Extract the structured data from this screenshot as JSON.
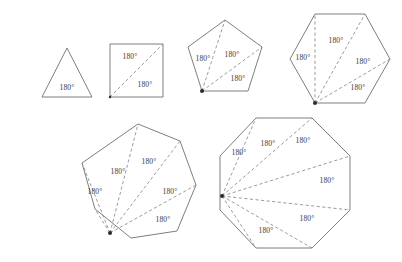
{
  "figure": {
    "background_color": "#ffffff",
    "outline_color": "#6f6f6f",
    "diagonal_color": "#8a8a8a",
    "label_color": "#3a3a3a",
    "apex_dot_color": "#2b2b2b",
    "angle_label": "180°",
    "degree_symbol": "°"
  },
  "chart_data": {
    "type": "diagram",
    "shapes": [
      {
        "name": "triangle",
        "sides": 3,
        "triangles": 1,
        "angle_sum_degrees": 180,
        "labels": [
          "180°"
        ]
      },
      {
        "name": "square",
        "sides": 4,
        "triangles": 2,
        "angle_sum_degrees": 360,
        "labels": [
          "180°",
          "180°"
        ]
      },
      {
        "name": "pentagon",
        "sides": 5,
        "triangles": 3,
        "angle_sum_degrees": 540,
        "labels": [
          "180°",
          "180°",
          "180°"
        ]
      },
      {
        "name": "hexagon",
        "sides": 6,
        "triangles": 4,
        "angle_sum_degrees": 720,
        "labels": [
          "180°",
          "180°",
          "180°",
          "180°"
        ]
      },
      {
        "name": "heptagon",
        "sides": 7,
        "triangles": 5,
        "angle_sum_degrees": 900,
        "labels": [
          "180°",
          "180°",
          "180°",
          "180°",
          "180°"
        ]
      },
      {
        "name": "octagon",
        "sides": 8,
        "triangles": 6,
        "angle_sum_degrees": 1080,
        "labels": [
          "180°",
          "180°",
          "180°",
          "180°",
          "180°",
          "180°"
        ]
      }
    ]
  },
  "shapes": {
    "triangle": {
      "name": "triangle",
      "outline_points": "67,48 92,97 42,97",
      "diagonals": [],
      "apex": null,
      "labels": [
        {
          "text": "180°",
          "x": 67,
          "y": 88
        }
      ]
    },
    "square": {
      "name": "square",
      "outline_points": "110,44 163,44 163,97 110,97",
      "diagonals": [
        {
          "x1": 110,
          "y1": 97,
          "x2": 163,
          "y2": 44
        }
      ],
      "apex": {
        "x": 110,
        "y": 97
      },
      "labels": [
        {
          "text": "180°",
          "x": 130,
          "y": 57
        },
        {
          "text": "180°",
          "x": 145,
          "y": 85
        }
      ]
    },
    "pentagon": {
      "name": "pentagon",
      "outline_points": "225,20 262,47 248,91 202,91 188,47",
      "diagonals": [
        {
          "x1": 202,
          "y1": 91,
          "x2": 225,
          "y2": 20
        },
        {
          "x1": 202,
          "y1": 91,
          "x2": 262,
          "y2": 47
        }
      ],
      "apex": {
        "x": 202,
        "y": 91
      },
      "labels": [
        {
          "text": "180°",
          "x": 203,
          "y": 59
        },
        {
          "text": "180°",
          "x": 232,
          "y": 55
        },
        {
          "text": "180°",
          "x": 238,
          "y": 79
        }
      ]
    },
    "hexagon": {
      "name": "hexagon",
      "outline_points": "315,14 365,14 390,59 365,103 315,103 290,59",
      "diagonals": [
        {
          "x1": 315,
          "y1": 103,
          "x2": 315,
          "y2": 14
        },
        {
          "x1": 315,
          "y1": 103,
          "x2": 365,
          "y2": 14
        },
        {
          "x1": 315,
          "y1": 103,
          "x2": 390,
          "y2": 59
        }
      ],
      "apex": {
        "x": 315,
        "y": 103
      },
      "labels": [
        {
          "text": "180°",
          "x": 303,
          "y": 58
        },
        {
          "text": "180°",
          "x": 336,
          "y": 41
        },
        {
          "text": "180°",
          "x": 363,
          "y": 62
        },
        {
          "text": "180°",
          "x": 358,
          "y": 88
        }
      ]
    },
    "heptagon": {
      "name": "heptagon",
      "outline_points": "138,124 180,141 196,185 177,231 131,238 95,209 82,163",
      "diagonals": [
        {
          "x1": 110,
          "y1": 233,
          "x2": 82,
          "y2": 163
        },
        {
          "x1": 110,
          "y1": 233,
          "x2": 95,
          "y2": 209
        },
        {
          "x1": 110,
          "y1": 233,
          "x2": 138,
          "y2": 124
        },
        {
          "x1": 110,
          "y1": 233,
          "x2": 196,
          "y2": 185
        },
        {
          "x1": 110,
          "y1": 233,
          "x2": 180,
          "y2": 141
        }
      ],
      "apex": {
        "x": 110,
        "y": 233
      },
      "labels": [
        {
          "text": "180°",
          "x": 95,
          "y": 192
        },
        {
          "text": "180°",
          "x": 118,
          "y": 172
        },
        {
          "text": "180°",
          "x": 149,
          "y": 162
        },
        {
          "text": "180°",
          "x": 170,
          "y": 192
        },
        {
          "text": "180°",
          "x": 163,
          "y": 220
        }
      ]
    },
    "octagon": {
      "name": "octagon",
      "outline_points": "256,118 312,118 350,156 350,210 312,248 256,248 220,210 220,156",
      "diagonals": [
        {
          "x1": 222,
          "y1": 196,
          "x2": 256,
          "y2": 118
        },
        {
          "x1": 222,
          "y1": 196,
          "x2": 312,
          "y2": 118
        },
        {
          "x1": 222,
          "y1": 196,
          "x2": 350,
          "y2": 156
        },
        {
          "x1": 222,
          "y1": 196,
          "x2": 350,
          "y2": 210
        },
        {
          "x1": 222,
          "y1": 196,
          "x2": 312,
          "y2": 248
        },
        {
          "x1": 222,
          "y1": 196,
          "x2": 256,
          "y2": 248
        }
      ],
      "apex": {
        "x": 222,
        "y": 196
      },
      "labels": [
        {
          "text": "180°",
          "x": 239,
          "y": 153
        },
        {
          "text": "180°",
          "x": 268,
          "y": 144
        },
        {
          "text": "180°",
          "x": 303,
          "y": 141
        },
        {
          "text": "180°",
          "x": 327,
          "y": 181
        },
        {
          "text": "180°",
          "x": 307,
          "y": 219
        },
        {
          "text": "180°",
          "x": 266,
          "y": 231
        }
      ]
    }
  }
}
